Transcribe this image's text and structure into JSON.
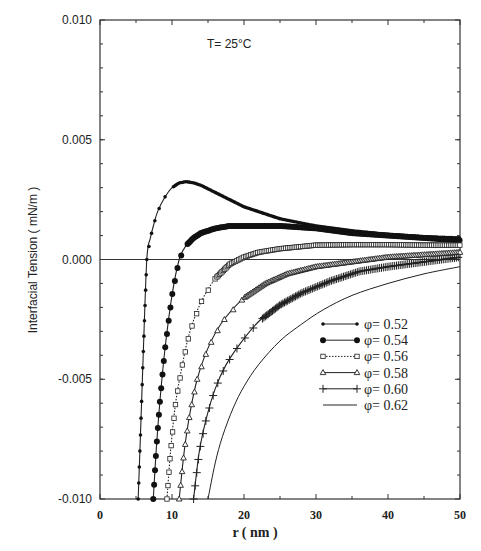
{
  "chart_data": {
    "type": "line",
    "title": "",
    "annotation": "T= 25°C",
    "xlabel": "r ( nm )",
    "ylabel": "Interfacial Tension ( mN/m )",
    "xlim": [
      0,
      50
    ],
    "ylim": [
      -0.01,
      0.01
    ],
    "xticks": [
      "0",
      "10",
      "20",
      "30",
      "40",
      "50"
    ],
    "yticks": [
      "0.010",
      "0.005",
      "0.000",
      "-0.005",
      "-0.010"
    ],
    "grid": false,
    "zero_line": true,
    "legend_position": "lower right",
    "series": [
      {
        "name": "φ= 0.52",
        "marker": "small-filled-circle",
        "line": "solid",
        "x": [
          5.3,
          5.6,
          6.0,
          6.5,
          7.0,
          7.5,
          8.0,
          9.0,
          10.0,
          11.0,
          12.0,
          13.0,
          14.0,
          16.0,
          18.0,
          20.0,
          25.0,
          30.0,
          35.0,
          40.0,
          45.0,
          50.0
        ],
        "y": [
          -0.01,
          -0.0075,
          -0.004,
          0.0,
          0.0009,
          0.0015,
          0.002,
          0.0026,
          0.003,
          0.0032,
          0.00325,
          0.0032,
          0.0031,
          0.0028,
          0.0025,
          0.0022,
          0.0017,
          0.0014,
          0.0012,
          0.00105,
          0.00095,
          0.0009
        ]
      },
      {
        "name": "φ= 0.54",
        "marker": "large-filled-circle",
        "line": "solid",
        "x": [
          7.4,
          7.8,
          8.3,
          9.0,
          10.0,
          11.0,
          12.0,
          13.0,
          14.0,
          16.0,
          18.0,
          20.0,
          25.0,
          30.0,
          35.0,
          40.0,
          45.0,
          50.0
        ],
        "y": [
          -0.01,
          -0.008,
          -0.006,
          -0.0038,
          -0.0015,
          0.0,
          0.0006,
          0.0009,
          0.0011,
          0.0013,
          0.0014,
          0.0014,
          0.0014,
          0.0013,
          0.0011,
          0.001,
          0.0009,
          0.0008
        ]
      },
      {
        "name": "φ= 0.56",
        "marker": "open-square",
        "line": "dotted",
        "x": [
          9.3,
          9.8,
          10.5,
          11.5,
          12.5,
          14.0,
          16.0,
          18.0,
          20.0,
          22.0,
          25.0,
          30.0,
          35.0,
          40.0,
          45.0,
          50.0
        ],
        "y": [
          -0.01,
          -0.008,
          -0.006,
          -0.0043,
          -0.003,
          -0.0018,
          -0.0008,
          -0.0002,
          0.0001,
          0.0003,
          0.00045,
          0.0006,
          0.00062,
          0.00062,
          0.0006,
          0.0006
        ]
      },
      {
        "name": "φ= 0.58",
        "marker": "open-triangle",
        "line": "solid",
        "x": [
          11.0,
          11.7,
          12.5,
          13.5,
          15.0,
          17.0,
          20.0,
          23.0,
          26.0,
          30.0,
          35.0,
          40.0,
          45.0,
          50.0
        ],
        "y": [
          -0.01,
          -0.008,
          -0.0064,
          -0.005,
          -0.0037,
          -0.0026,
          -0.0016,
          -0.001,
          -0.0006,
          -0.0003,
          -0.0001,
          0.0001,
          0.0002,
          0.0003
        ]
      },
      {
        "name": "φ= 0.60",
        "marker": "plus",
        "line": "solid",
        "x": [
          13.0,
          13.8,
          14.8,
          16.0,
          17.5,
          19.5,
          22.0,
          25.0,
          28.0,
          32.0,
          36.0,
          40.0,
          45.0,
          50.0
        ],
        "y": [
          -0.01,
          -0.008,
          -0.0066,
          -0.0054,
          -0.0044,
          -0.0035,
          -0.0026,
          -0.0019,
          -0.0014,
          -0.0009,
          -0.0005,
          -0.0003,
          -0.0001,
          0.0001
        ]
      },
      {
        "name": "φ= 0.62",
        "marker": "none",
        "line": "solid-thin",
        "x": [
          15.0,
          16.0,
          17.0,
          18.5,
          20.0,
          22.0,
          25.0,
          28.0,
          31.0,
          35.0,
          40.0,
          45.0,
          50.0
        ],
        "y": [
          -0.01,
          -0.0085,
          -0.0074,
          -0.0062,
          -0.0053,
          -0.0044,
          -0.0034,
          -0.0027,
          -0.0021,
          -0.0015,
          -0.001,
          -0.0006,
          -0.0003
        ]
      }
    ]
  }
}
